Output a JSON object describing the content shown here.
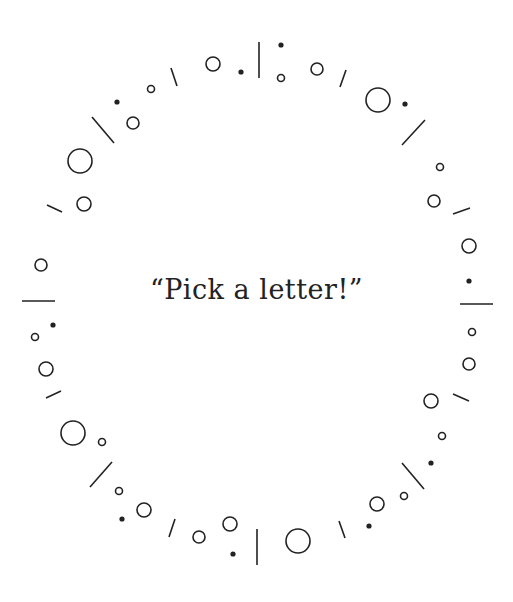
{
  "caption": "“Pick a letter!”",
  "colors": {
    "ink": "#222222",
    "background": "#ffffff"
  },
  "ring": {
    "lines": [
      [
        259,
        42,
        259,
        78
      ],
      [
        171,
        68,
        177,
        86
      ],
      [
        92,
        117,
        114,
        143
      ],
      [
        47,
        205,
        62,
        212
      ],
      [
        346,
        70,
        340,
        87
      ],
      [
        425,
        120,
        402,
        145
      ],
      [
        470,
        208,
        453,
        214
      ],
      [
        22,
        301,
        55,
        301
      ],
      [
        460,
        304,
        493,
        304
      ],
      [
        46,
        398,
        61,
        391
      ],
      [
        112,
        462,
        90,
        487
      ],
      [
        175,
        519,
        169,
        537
      ],
      [
        257,
        529,
        257,
        565
      ],
      [
        339,
        521,
        345,
        538
      ],
      [
        402,
        463,
        424,
        489
      ],
      [
        453,
        394,
        469,
        401
      ]
    ],
    "circles": [
      [
        281,
        78,
        3.5
      ],
      [
        213,
        64,
        7
      ],
      [
        151,
        89,
        3.5
      ],
      [
        133,
        123,
        6
      ],
      [
        80,
        161,
        12
      ],
      [
        84,
        204,
        7
      ],
      [
        41,
        265,
        6
      ],
      [
        317,
        69,
        6
      ],
      [
        378,
        100,
        12
      ],
      [
        440,
        167,
        3.5
      ],
      [
        434,
        201,
        6
      ],
      [
        469,
        246,
        7
      ],
      [
        35,
        337,
        3.5
      ],
      [
        46,
        369,
        7
      ],
      [
        73,
        433,
        12
      ],
      [
        102,
        442,
        3.5
      ],
      [
        119,
        491,
        3.5
      ],
      [
        144,
        510,
        7
      ],
      [
        199,
        537,
        6
      ],
      [
        230,
        524,
        7
      ],
      [
        298,
        541,
        12
      ],
      [
        377,
        504,
        7
      ],
      [
        404,
        496,
        3.5
      ],
      [
        442,
        436,
        3.5
      ],
      [
        431,
        401,
        7
      ],
      [
        469,
        364,
        6
      ],
      [
        472,
        332,
        3.5
      ]
    ],
    "dots": [
      [
        281,
        45
      ],
      [
        241,
        72
      ],
      [
        117,
        102
      ],
      [
        405,
        104
      ],
      [
        469,
        281
      ],
      [
        53,
        325
      ],
      [
        122,
        519
      ],
      [
        233,
        554
      ],
      [
        369,
        526
      ],
      [
        431,
        463
      ]
    ]
  }
}
